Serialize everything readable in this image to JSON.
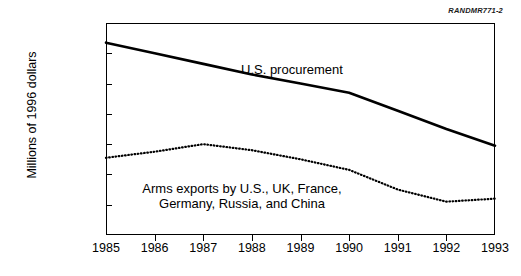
{
  "figure_id": "RANDMR771-2",
  "axis": {
    "ylabel": "Millions of 1996 dollars"
  },
  "annotations": {
    "procurement": "U.S. procurement",
    "exports_line1": "Arms exports by U.S., UK, France,",
    "exports_line2": "Germany, Russia, and China"
  },
  "chart_data": {
    "type": "line",
    "title": "",
    "xlabel": "",
    "ylabel": "Millions of 1996 dollars",
    "xlim": [
      1985,
      1993
    ],
    "ylim": [
      0,
      140000
    ],
    "grid": false,
    "legend_position": "inline-annotation",
    "x": [
      1985,
      1986,
      1987,
      1988,
      1989,
      1990,
      1991,
      1992,
      1993
    ],
    "xtick_labels": [
      "1985",
      "1986",
      "1987",
      "1988",
      "1989",
      "1990",
      "1991",
      "1992",
      "1993"
    ],
    "ytick_values": [
      0,
      20000,
      40000,
      60000,
      80000,
      100000,
      120000,
      140000
    ],
    "ytick_labels": [
      "0",
      "20,000",
      "40,000",
      "60,000",
      "80,000",
      "100,000",
      "120,000",
      "140,000"
    ],
    "series": [
      {
        "name": "U.S. procurement",
        "style": "solid",
        "color": "#000000",
        "values": [
          127000,
          120000,
          113000,
          106000,
          100000,
          94000,
          82000,
          70000,
          59000
        ]
      },
      {
        "name": "Arms exports by U.S., UK, France, Germany, Russia, and China",
        "style": "dotted",
        "color": "#000000",
        "values": [
          51000,
          55000,
          60000,
          56000,
          50000,
          43000,
          30000,
          22000,
          24000
        ]
      }
    ]
  }
}
